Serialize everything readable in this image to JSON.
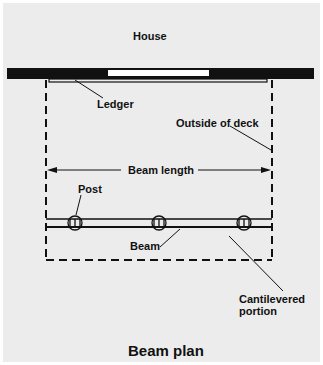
{
  "diagram": {
    "title": "Beam plan",
    "labels": {
      "house": "House",
      "ledger": "Ledger",
      "outside_of_deck": "Outside of deck",
      "beam_length": "Beam length",
      "post": "Post",
      "beam": "Beam",
      "cantilevered_line1": "Cantilevered",
      "cantilevered_line2": "portion"
    },
    "elements": {
      "house_wall": "solid black wall with window opening",
      "ledger": "thin board along house wall",
      "deck_outline": "dashed rectangle",
      "beam": "double line across deck",
      "posts_count": 3,
      "dimension": "double-headed arrow spanning deck width"
    },
    "colors": {
      "background": "#ececec",
      "ink": "#111111",
      "window": "#ffffff"
    }
  }
}
